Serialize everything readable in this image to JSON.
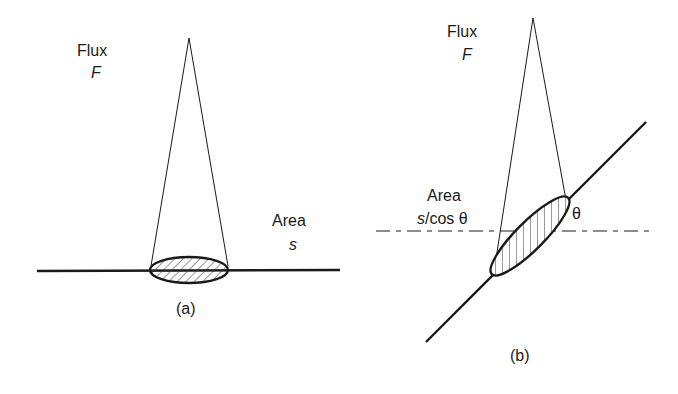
{
  "panel_a": {
    "flux_label": "Flux",
    "flux_symbol": "F",
    "area_label": "Area",
    "area_symbol": "s",
    "caption": "(a)"
  },
  "panel_b": {
    "flux_label": "Flux",
    "flux_symbol": "F",
    "area_label": "Area",
    "area_symbol_s": "s",
    "area_symbol_rest": "/cos θ",
    "angle_symbol": "θ",
    "caption": "(b)"
  },
  "colors": {
    "ink": "#1a1a1a",
    "background": "#ffffff"
  }
}
